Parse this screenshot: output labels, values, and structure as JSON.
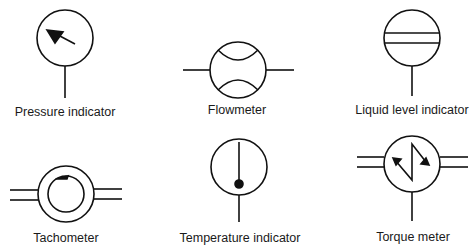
{
  "diagram": {
    "symbols": [
      {
        "id": "pressure",
        "label": "Pressure indicator",
        "icon": "pressure-indicator-icon"
      },
      {
        "id": "flow",
        "label": "Flowmeter",
        "icon": "flowmeter-icon"
      },
      {
        "id": "level",
        "label": "Liquid level indicator",
        "icon": "liquid-level-indicator-icon"
      },
      {
        "id": "tach",
        "label": "Tachometer",
        "icon": "tachometer-icon"
      },
      {
        "id": "temp",
        "label": "Temperature indicator",
        "icon": "temperature-indicator-icon"
      },
      {
        "id": "torque",
        "label": "Torque meter",
        "icon": "torque-meter-icon"
      }
    ],
    "colors": {
      "stroke": "#111111",
      "background": "#ffffff"
    }
  }
}
